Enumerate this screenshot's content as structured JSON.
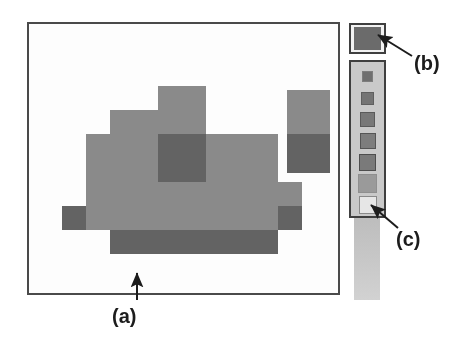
{
  "figure": {
    "kind": "paint-application-screenshot",
    "background_color": "#ffffff",
    "annotation_labels": [
      {
        "id": "a",
        "text": "(a)",
        "target": "drawing-canvas-border"
      },
      {
        "id": "b",
        "text": "(b)",
        "target": "selected-color-swatch"
      },
      {
        "id": "c",
        "text": "(c)",
        "target": "palette-swatch-7"
      }
    ]
  },
  "canvas": {
    "name": "drawing-canvas",
    "border_color": "#4a4a4a",
    "fill_color": "#fdfdfd",
    "grid_cell_px": 24,
    "tone_light": "#8a8a8a",
    "tone_dark": "#636363",
    "blob": {
      "name": "pixel-blob",
      "origin_x": 9,
      "origin_y": 62,
      "cells": [
        {
          "col": 5,
          "row": 0,
          "w": 2,
          "h": 2,
          "tone": "light"
        },
        {
          "col": 3,
          "row": 1,
          "w": 2,
          "h": 1,
          "tone": "light"
        },
        {
          "col": 2,
          "row": 2,
          "w": 3,
          "h": 1,
          "tone": "light"
        },
        {
          "col": 5,
          "row": 2,
          "w": 2,
          "h": 1,
          "tone": "dark"
        },
        {
          "col": 7,
          "row": 2,
          "w": 3,
          "h": 1,
          "tone": "light"
        },
        {
          "col": 2,
          "row": 3,
          "w": 3,
          "h": 1,
          "tone": "light"
        },
        {
          "col": 5,
          "row": 3,
          "w": 2,
          "h": 1,
          "tone": "dark"
        },
        {
          "col": 7,
          "row": 3,
          "w": 3,
          "h": 1,
          "tone": "light"
        },
        {
          "col": 2,
          "row": 4,
          "w": 9,
          "h": 1,
          "tone": "light"
        },
        {
          "col": 1,
          "row": 5,
          "w": 1,
          "h": 1,
          "tone": "dark"
        },
        {
          "col": 2,
          "row": 5,
          "w": 8,
          "h": 1,
          "tone": "light"
        },
        {
          "col": 10,
          "row": 5,
          "w": 1,
          "h": 1,
          "tone": "dark"
        },
        {
          "col": 3,
          "row": 6,
          "w": 7,
          "h": 1,
          "tone": "dark"
        }
      ]
    },
    "right_rect": {
      "name": "two-tone-rectangle",
      "x": 258,
      "y": 66,
      "w": 43,
      "h": 83,
      "top_tone": "light",
      "bottom_tone": "dark",
      "split_ratio": 0.53
    }
  },
  "selected_color": {
    "name": "selected-color-swatch",
    "color": "#6b6b6b",
    "box_border_color": "#3f3f3f",
    "box_fill": "#f2f2f2"
  },
  "palette": {
    "name": "color-palette",
    "box_border_color": "#3f3f3f",
    "box_fill": "#c9c9c9",
    "swatches": [
      {
        "index": 1,
        "color": "#6f6f6f",
        "size": 11,
        "border": "#7d7d7d"
      },
      {
        "index": 2,
        "color": "#747474",
        "size": 13,
        "border": "#5f5f5f"
      },
      {
        "index": 3,
        "color": "#787878",
        "size": 15,
        "border": "#5a5a5a"
      },
      {
        "index": 4,
        "color": "#7d7d7d",
        "size": 16,
        "border": "#555555"
      },
      {
        "index": 5,
        "color": "#7a7a7a",
        "size": 17,
        "border": "#4e4e4e"
      },
      {
        "index": 6,
        "color": "#9a9a9a",
        "size": 19,
        "border": "#8f8f8f"
      },
      {
        "index": 7,
        "color": "#e6e6e6",
        "size": 18,
        "border": "#8a8a8a"
      }
    ],
    "gradient_strip": {
      "name": "palette-gradient-strip",
      "from": "#bdbdbd",
      "to": "#d2d2d2"
    }
  }
}
